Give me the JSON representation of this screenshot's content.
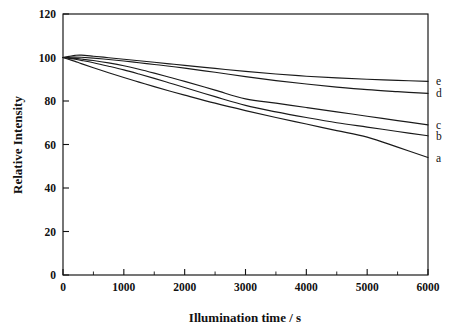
{
  "chart_data": {
    "type": "line",
    "title": "",
    "xlabel": "Illumination time / s",
    "ylabel": "Relative Intensity",
    "xlim": [
      0,
      6000
    ],
    "ylim": [
      0,
      120
    ],
    "xticks": [
      0,
      1000,
      2000,
      3000,
      4000,
      5000,
      6000
    ],
    "yticks": [
      0,
      20,
      40,
      60,
      80,
      100,
      120
    ],
    "xtick_labels": [
      "0",
      "1000",
      "2000",
      "3000",
      "4000",
      "5000",
      "6000"
    ],
    "ytick_labels": [
      "0",
      "20",
      "40",
      "60",
      "80",
      "100",
      "120"
    ],
    "x_minor_step": 500,
    "grid": false,
    "legend_position": "right-inline-end-labels",
    "frame": "box",
    "tick_direction": "in",
    "line_color": "#1a1a1a",
    "series": [
      {
        "name": "a",
        "label": "a",
        "end_value": 54,
        "x": [
          0,
          100,
          200,
          300,
          500,
          750,
          1000,
          1250,
          1500,
          1750,
          2000,
          2500,
          3000,
          3500,
          4000,
          4500,
          5000,
          5500,
          6000
        ],
        "values": [
          100,
          99.1,
          98.2,
          97.2,
          95.3,
          93.0,
          90.8,
          88.7,
          86.6,
          84.6,
          82.7,
          79.0,
          75.6,
          72.4,
          69.4,
          66.4,
          63.4,
          58.8,
          54.0
        ]
      },
      {
        "name": "b",
        "label": "b",
        "end_value": 64,
        "x": [
          0,
          100,
          200,
          300,
          500,
          750,
          1000,
          1250,
          1500,
          1750,
          2000,
          2500,
          3000,
          3500,
          4000,
          4500,
          5000,
          5500,
          6000
        ],
        "values": [
          100,
          99.6,
          99.2,
          98.7,
          97.6,
          96.0,
          94.3,
          92.4,
          90.4,
          88.3,
          86.2,
          82.0,
          78.0,
          75.0,
          72.4,
          70.0,
          68.0,
          66.0,
          64.0
        ]
      },
      {
        "name": "c",
        "label": "c",
        "end_value": 69,
        "x": [
          0,
          100,
          200,
          300,
          500,
          750,
          1000,
          1250,
          1500,
          1750,
          2000,
          2500,
          3000,
          3500,
          4000,
          4500,
          5000,
          5500,
          6000
        ],
        "values": [
          100,
          99.8,
          99.6,
          99.3,
          98.6,
          97.5,
          96.2,
          94.6,
          92.8,
          90.9,
          89.0,
          85.0,
          81.0,
          79.0,
          77.0,
          75.0,
          73.0,
          71.0,
          69.0
        ]
      },
      {
        "name": "d",
        "label": "d",
        "end_value": 83.5,
        "x": [
          0,
          100,
          200,
          300,
          500,
          750,
          1000,
          1250,
          1500,
          1750,
          2000,
          2500,
          3000,
          3500,
          4000,
          4500,
          5000,
          5500,
          6000
        ],
        "values": [
          100,
          100.1,
          100.2,
          100.1,
          99.7,
          99.1,
          98.4,
          97.6,
          96.8,
          96.0,
          95.1,
          93.2,
          91.2,
          89.4,
          87.8,
          86.4,
          85.2,
          84.3,
          83.5
        ]
      },
      {
        "name": "e",
        "label": "e",
        "end_value": 89,
        "x": [
          0,
          100,
          200,
          300,
          500,
          750,
          1000,
          1250,
          1500,
          1750,
          2000,
          2500,
          3000,
          3500,
          4000,
          4500,
          5000,
          5500,
          6000
        ],
        "values": [
          100,
          100.5,
          101.0,
          101.1,
          100.6,
          99.9,
          99.2,
          98.5,
          97.8,
          97.1,
          96.4,
          95.0,
          93.6,
          92.4,
          91.4,
          90.6,
          90.0,
          89.5,
          89.0
        ]
      }
    ]
  },
  "axes": {
    "xlabel": "Illumination time / s",
    "ylabel": "Relative Intensity"
  }
}
